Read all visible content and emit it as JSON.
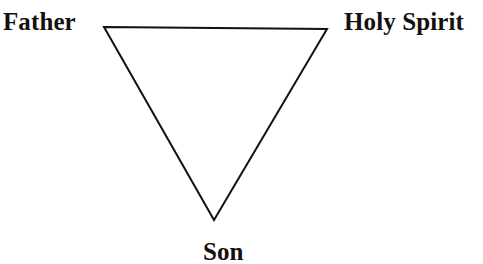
{
  "diagram": {
    "type": "triangle-diagram",
    "background_color": "#ffffff",
    "stroke_color": "#15100f",
    "stroke_width": 2,
    "orientation": "inverted",
    "vertices": [
      {
        "id": "top-left",
        "x": 104,
        "y": 27,
        "label_id": "father"
      },
      {
        "id": "top-right",
        "x": 327,
        "y": 29,
        "label_id": "holy-spirit"
      },
      {
        "id": "bottom",
        "x": 214,
        "y": 220,
        "label_id": "son"
      }
    ],
    "edges": [
      {
        "from": "top-left",
        "to": "top-right"
      },
      {
        "from": "top-right",
        "to": "bottom"
      },
      {
        "from": "bottom",
        "to": "top-left"
      }
    ],
    "labels": {
      "father": "Father",
      "holy_spirit": "Holy Spirit",
      "son": "Son"
    }
  }
}
